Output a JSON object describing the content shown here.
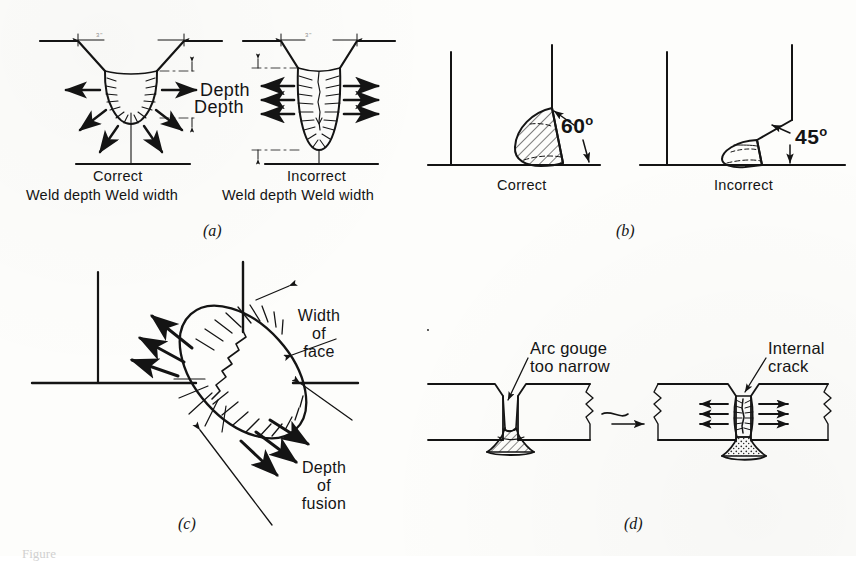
{
  "figure": {
    "type": "technical-illustration",
    "caption_partial": "Figure",
    "background_color": "#fdfdfb",
    "ink_color": "#141414"
  },
  "panels": [
    {
      "id": "a",
      "letter": "(a)",
      "subject": "Groove weld depth vs width",
      "left": {
        "title": "Correct",
        "subtitle": "Weld depth  Weld width",
        "depth_label": "Depth",
        "dimension_note": "3\"",
        "bead": "wide shallow U"
      },
      "right": {
        "title": "Incorrect",
        "subtitle": "Weld depth  Weld width",
        "depth_label": "Depth",
        "dimension_note": "3\"",
        "bead": "deep narrow U with centerline crack"
      }
    },
    {
      "id": "b",
      "letter": "(b)",
      "subject": "Fillet weld included angle",
      "left": {
        "title": "Correct",
        "angle": "60",
        "degree_symbol": "o"
      },
      "right": {
        "title": "Incorrect",
        "angle": "45",
        "degree_symbol": "o"
      }
    },
    {
      "id": "c",
      "letter": "(c)",
      "subject": "Fillet weld width of face vs depth of fusion",
      "labels": {
        "width_of_face": [
          "Width",
          "of",
          "face"
        ],
        "depth_of_fusion": [
          "Depth",
          "of",
          "fusion"
        ]
      }
    },
    {
      "id": "d",
      "letter": "(d)",
      "subject": "Narrow arc gouge leading to internal crack",
      "left_label": [
        "Arc gouge",
        "too narrow"
      ],
      "right_label": [
        "Internal",
        "crack"
      ],
      "transition": "squiggle-arrow"
    }
  ]
}
